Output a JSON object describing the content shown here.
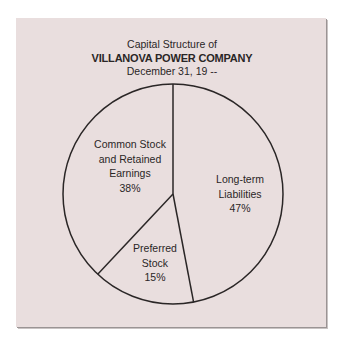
{
  "chart_data": {
    "type": "pie",
    "title": "Capital Structure of",
    "subtitle": "VILLANOVA POWER COMPANY",
    "date_line": "December 31, 19 --",
    "start_angle": "12 o'clock, clockwise",
    "slices": [
      {
        "label_line1": "Long-term",
        "label_line2": "Liabilities",
        "label_line3": "",
        "value": 47,
        "pct_label": "47%"
      },
      {
        "label_line1": "Preferred",
        "label_line2": "Stock",
        "label_line3": "",
        "value": 15,
        "pct_label": "15%"
      },
      {
        "label_line1": "Common Stock",
        "label_line2": "and Retained",
        "label_line3": "Earnings",
        "value": 38,
        "pct_label": "38%"
      }
    ],
    "categories": [
      "Long-term Liabilities",
      "Preferred Stock",
      "Common Stock and Retained Earnings"
    ],
    "values": [
      47,
      15,
      38
    ],
    "legend": "none (labels inside slices)"
  },
  "colors": {
    "panel_bg": "#e9dede",
    "line": "#2a2626",
    "page_bg": "#ffffff"
  }
}
